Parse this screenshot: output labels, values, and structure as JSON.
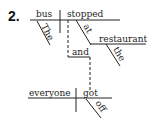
{
  "item_number": "2.",
  "diagram": {
    "subject_1": "bus",
    "modifier_subject_1": "The",
    "verb_1": "stopped",
    "preposition": "at",
    "object_of_preposition": "restaurant",
    "modifier_object": "the",
    "conjunction": "and",
    "subject_2": "everyone",
    "verb_2": "got",
    "modifier_verb_2": "off"
  }
}
